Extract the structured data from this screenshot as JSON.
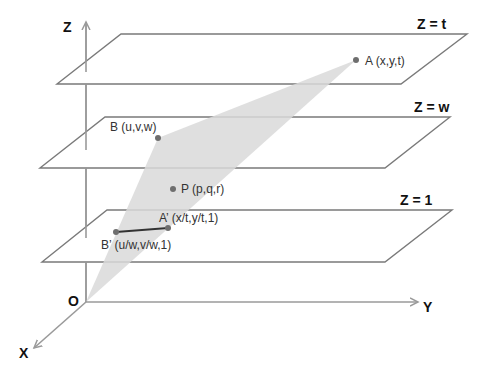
{
  "diagram": {
    "type": "3D projective planes diagram",
    "axes": {
      "z_label": "Z",
      "y_label": "Y",
      "x_label": "X",
      "origin_label": "O"
    },
    "planes": [
      {
        "label": "Z = t"
      },
      {
        "label": "Z = w"
      },
      {
        "label": "Z = 1"
      }
    ],
    "points": {
      "A": "A (x,y,t)",
      "B": "B (u,v,w)",
      "P": "P (p,q,r)",
      "A_prime": "A’ (x/t,y/t,1)",
      "B_prime": "B’ (u/w,v/w,1)"
    },
    "colors": {
      "line": "#7a7a7a",
      "axis": "#9a9a9a",
      "shade": "#dcdcdc",
      "point": "#6e6e6e",
      "segment": "#333333"
    }
  }
}
